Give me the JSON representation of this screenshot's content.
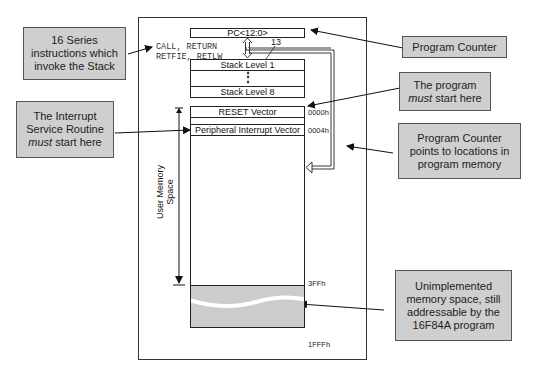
{
  "diagram": {
    "program_counter": {
      "label": "PC<12:0>",
      "bus_width": "13"
    },
    "stack": {
      "levels": [
        "Stack Level 1",
        "Stack Level 8"
      ],
      "ellipsis": "⋮"
    },
    "stack_instructions": {
      "line1": "CALL, RETURN",
      "line2": "RETFIE, RETLW"
    },
    "memory": {
      "rows": [
        {
          "label": "RESET Vector",
          "address": "0000h"
        },
        {
          "label": "Peripheral Interrupt Vector",
          "address": "0004h"
        }
      ],
      "user_space_end": "3FFh",
      "memory_end": "1FFFh",
      "user_memory_label_line1": "User Memory",
      "user_memory_label_line2": "Space"
    },
    "callouts": {
      "stack_instructions": "16 Series instructions which invoke the Stack",
      "interrupt": {
        "text1": "The Interrupt Service Routine",
        "emph": "must",
        "text2": " start  here"
      },
      "program_counter": "Program Counter",
      "program_start": {
        "text1": "The program",
        "emph": "must",
        "text2": " start  here"
      },
      "pc_points": "Program Counter points to locations in program memory",
      "unimplemented": "Unimplemented memory space, still addressable by the 16F84A program"
    },
    "colors": {
      "callout_fill": "#cfcfcf",
      "unimplemented_fill": "#cccccc",
      "line": "#222222"
    }
  }
}
